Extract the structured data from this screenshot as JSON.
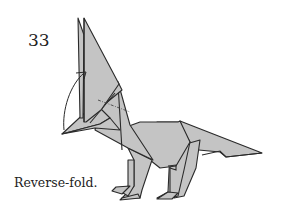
{
  "step": {
    "number": "33"
  },
  "instruction": {
    "text": "Reverse-fold."
  },
  "figure": {
    "paper_color": "#c4c4c4",
    "line_color": "#2a2a2a",
    "annotations": [
      "valley-fold-dash-dot-line",
      "reverse-fold-arrow"
    ]
  }
}
